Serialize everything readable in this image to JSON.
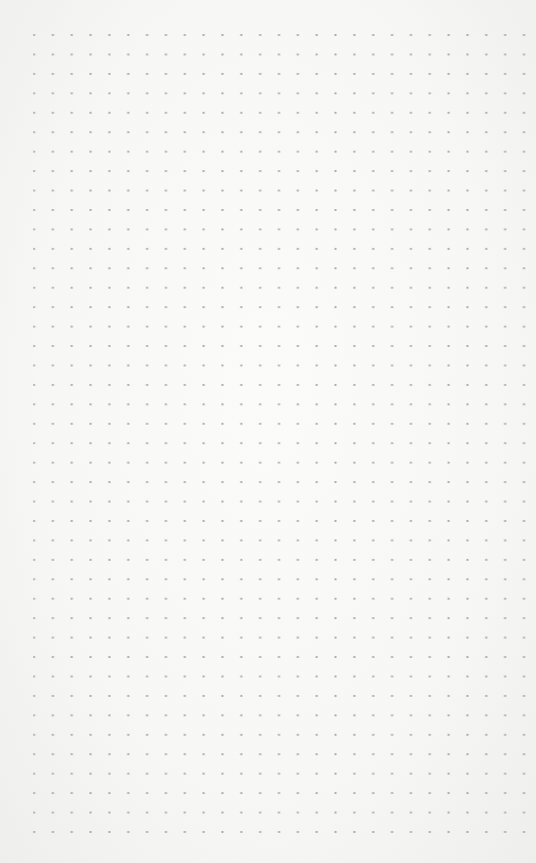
{
  "page": {
    "type": "dot-grid paper",
    "background_color": "#f7f7f6",
    "dot_color": "#a9a9a9",
    "columns": 27,
    "rows": 42
  }
}
